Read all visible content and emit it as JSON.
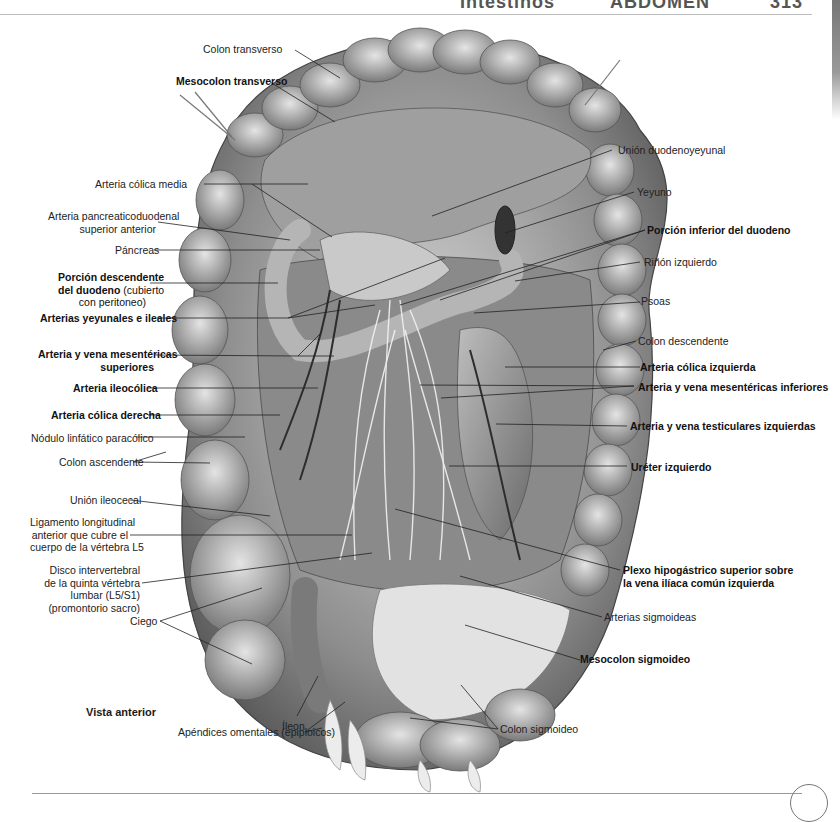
{
  "header": {
    "section_left": "Intestinos",
    "section_center": "ABDOMEN",
    "page_number": "313"
  },
  "figure": {
    "view_caption": "Vista anterior",
    "labels_left": {
      "colon_transverso": "Colon transverso",
      "mesocolon_transverso": "Mesocolon transverso",
      "arteria_colica_media": "Arteria cólica media",
      "arteria_pancreaticoduodenal_1": "Arteria pancreaticoduodenal",
      "arteria_pancreaticoduodenal_2": "superior anterior",
      "pancreas": "Páncreas",
      "porcion_descendente_1": "Porción descendente",
      "porcion_descendente_2": "del duodeno",
      "porcion_descendente_2b": " (cubierto",
      "porcion_descendente_3": "con peritoneo)",
      "arterias_yeyunales": "Arterias yeyunales e ileales",
      "arteria_vena_mes_sup_1": "Arteria y vena mesentéricas",
      "arteria_vena_mes_sup_2": "superiores",
      "arteria_ileocolica": "Arteria ileocólica",
      "arteria_colica_derecha": "Arteria cólica derecha",
      "nodulo_linfatico": "Nódulo linfático paracólico",
      "colon_ascendente": "Colon ascendente",
      "union_ileocecal": "Unión ileocecal",
      "ligamento_1": "Ligamento longitudinal",
      "ligamento_2": "anterior que cubre el",
      "ligamento_3": "cuerpo de la vértebra L5",
      "disco_1": "Disco intervertebral",
      "disco_2": "de la quinta vértebra",
      "disco_3": "lumbar (L5/S1)",
      "disco_4": "(promontorio sacro)",
      "ciego": "Ciego",
      "ileon": "Íleon",
      "apendices": "Apéndices omentales (epiploicos)"
    },
    "labels_right": {
      "union_duodenoyeyunal": "Unión duodenoyeyunal",
      "yeyuno": "Yeyuno",
      "porcion_inferior_duodeno": "Porción inferior del duodeno",
      "rinon_izquierdo": "Riñón izquierdo",
      "psoas": "Psoas",
      "colon_descendente": "Colon descendente",
      "arteria_colica_izquierda": "Arteria cólica izquierda",
      "arteria_vena_mes_inf": "Arteria y vena mesentéricas inferiores",
      "arteria_vena_testiculares": "Arteria y vena testiculares izquierdas",
      "ureter_izquierdo": "Uréter izquierdo",
      "plexo_1": "Plexo hipogástrico superior sobre",
      "plexo_2": "la vena ilíaca común izquierda",
      "arterias_sigmoideas": "Arterias sigmoideas",
      "mesocolon_sigmoideo": "Mesocolon sigmoideo",
      "colon_sigmoideo": "Colon sigmoideo"
    }
  }
}
